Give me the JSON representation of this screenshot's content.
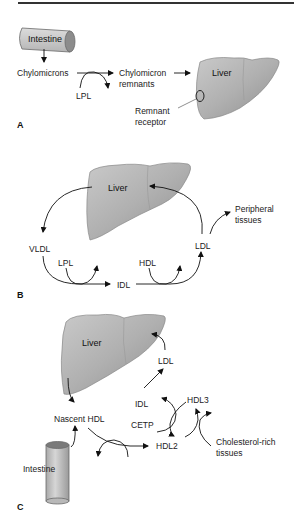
{
  "panels": {
    "A": {
      "letter": "A",
      "intestine": "Intestine",
      "chylomicrons": "Chylomicrons",
      "lpl": "LPL",
      "chylomicron_remnants_1": "Chylomicron",
      "chylomicron_remnants_2": "remnants",
      "liver": "Liver",
      "remnant_receptor_1": "Remnant",
      "remnant_receptor_2": "receptor"
    },
    "B": {
      "letter": "B",
      "liver": "Liver",
      "vldl": "VLDL",
      "lpl": "LPL",
      "idl": "IDL",
      "hdl": "HDL",
      "ldl": "LDL",
      "peripheral_1": "Peripheral",
      "peripheral_2": "tissues"
    },
    "C": {
      "letter": "C",
      "liver": "Liver",
      "ldl": "LDL",
      "idl": "IDL",
      "hdl3": "HDL3",
      "cetp": "CETP",
      "nascent_hdl": "Nascent HDL",
      "hdl2": "HDL2",
      "cholesterol_1": "Cholesterol-rich",
      "cholesterol_2": "tissues",
      "intestine": "Intestine"
    }
  },
  "colors": {
    "organ_fill": "#b5b5b5",
    "organ_stroke": "#8a8a8a",
    "arrow": "#111111"
  }
}
